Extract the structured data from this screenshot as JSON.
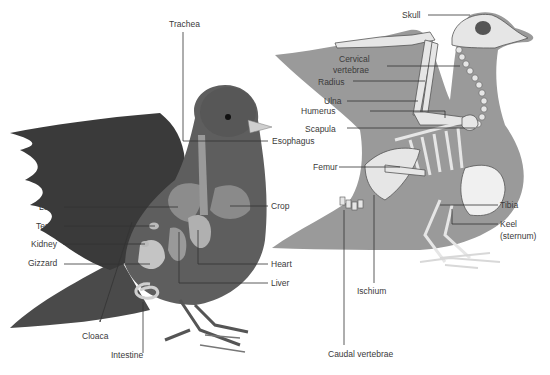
{
  "diagram": {
    "colors": {
      "background": "#ffffff",
      "bird_body": "#5a5a5a",
      "bird_body_light": "#8a8a8a",
      "wing_dark": "#3a3a3a",
      "silhouette": "#9a9a9a",
      "bone": "#e8e8e8",
      "leader_line": "#333333",
      "label_text": "#3a3a3a"
    },
    "left_figure": {
      "name": "Internal organs (pigeon)",
      "labels": {
        "trachea": "Trachea",
        "esophagus": "Esophagus",
        "lung": "Lung",
        "testis": "Testis",
        "kidney": "Kidney",
        "gizzard": "Gizzard",
        "crop": "Crop",
        "heart": "Heart",
        "liver": "Liver",
        "cloaca": "Cloaca",
        "intestine": "Intestine"
      }
    },
    "right_figure": {
      "name": "Skeleton (pigeon)",
      "labels": {
        "skull": "Skull",
        "cervical_1": "Cervical",
        "cervical_2": "vertebrae",
        "radius": "Radius",
        "ulna": "Ulna",
        "humerus": "Humerus",
        "scapula": "Scapula",
        "femur": "Femur",
        "tibia": "Tibia",
        "keel_1": "Keel",
        "keel_2": "(sternum)",
        "ischium": "Ischium",
        "caudal": "Caudal vertebrae"
      }
    }
  }
}
